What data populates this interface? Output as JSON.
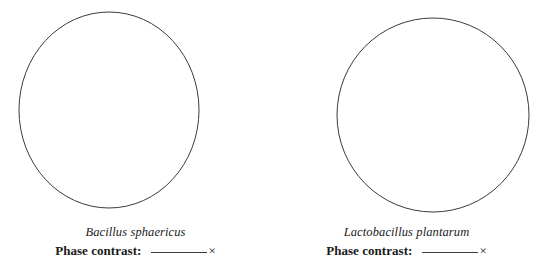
{
  "page": {
    "background_color": "#ffffff",
    "stroke_color": "#3a3a3a",
    "text_color": "#1a1a1a"
  },
  "panels": [
    {
      "id": "left",
      "field_of_view": {
        "shape": "circle",
        "icon": "microscope-field-circle",
        "center_x": 109,
        "center_y": 110,
        "radius_x": 90,
        "radius_y": 98
      },
      "species_name": "Bacillus sphaericus",
      "magnification_label": "Phase contrast:",
      "magnification_value": "",
      "magnification_unit": "×"
    },
    {
      "id": "right",
      "field_of_view": {
        "shape": "circle",
        "icon": "microscope-field-circle",
        "center_x": 162,
        "center_y": 115,
        "radius_x": 96,
        "radius_y": 97
      },
      "species_name": "Lactobacillus plantarum",
      "magnification_label": "Phase contrast:",
      "magnification_value": "",
      "magnification_unit": "×"
    }
  ]
}
